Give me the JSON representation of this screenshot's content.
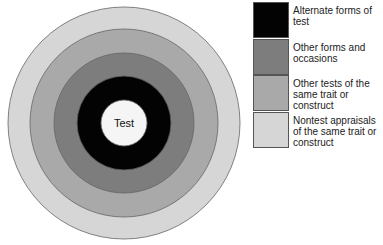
{
  "center_label": "Test",
  "rings": [
    {
      "name": "nontest-appraisals",
      "color": "#d6d6d6",
      "radius": 116
    },
    {
      "name": "other-tests-same-trait",
      "color": "#a9a9a9",
      "radius": 94
    },
    {
      "name": "other-forms-occasions",
      "color": "#7d7d7d",
      "radius": 70
    },
    {
      "name": "alternate-forms",
      "color": "#030303",
      "radius": 47
    },
    {
      "name": "test",
      "color": "#f5f5f5",
      "radius": 23
    }
  ],
  "legend": [
    {
      "label": "Alternate forms of test",
      "color": "#030303"
    },
    {
      "label": "Other forms and occasions",
      "color": "#7d7d7d"
    },
    {
      "label": "Other tests of the same trait or construct",
      "color": "#a9a9a9"
    },
    {
      "label": "Nontest appraisals of the same trait or construct",
      "color": "#d6d6d6"
    }
  ]
}
